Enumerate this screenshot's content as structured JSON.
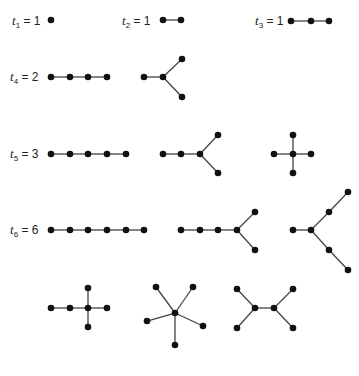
{
  "figure": {
    "rows": [
      {
        "id": "t1",
        "symbol": "t",
        "subscript": "1",
        "eq": " = 1",
        "value": 1,
        "label_pos": [
          12,
          14
        ]
      },
      {
        "id": "t2",
        "symbol": "t",
        "subscript": "2",
        "eq": " = 1",
        "value": 1,
        "label_pos": [
          122,
          14
        ]
      },
      {
        "id": "t3",
        "symbol": "t",
        "subscript": "3",
        "eq": " = 1",
        "value": 1,
        "label_pos": [
          255,
          14
        ]
      },
      {
        "id": "t4",
        "symbol": "t",
        "subscript": "4",
        "eq": " = 2",
        "value": 2,
        "label_pos": [
          10,
          70
        ]
      },
      {
        "id": "t5",
        "symbol": "t",
        "subscript": "5",
        "eq": " = 3",
        "value": 3,
        "label_pos": [
          10,
          147
        ]
      },
      {
        "id": "t6",
        "symbol": "t",
        "subscript": "6",
        "eq": " = 6",
        "value": 6,
        "label_pos": [
          10,
          223
        ]
      }
    ],
    "trees": [
      {
        "name": "t1-single",
        "order": 1,
        "nodes": [
          [
            51,
            20
          ]
        ],
        "edges": []
      },
      {
        "name": "t2-edge",
        "order": 2,
        "nodes": [
          [
            163,
            20
          ],
          [
            181,
            20
          ]
        ],
        "edges": [
          [
            0,
            1
          ]
        ]
      },
      {
        "name": "t3-path",
        "order": 3,
        "nodes": [
          [
            291,
            21
          ],
          [
            311,
            21
          ],
          [
            329,
            21
          ]
        ],
        "edges": [
          [
            0,
            1
          ],
          [
            1,
            2
          ]
        ]
      },
      {
        "name": "t4-path",
        "order": 4,
        "nodes": [
          [
            51,
            77
          ],
          [
            70,
            77
          ],
          [
            88,
            77
          ],
          [
            107,
            77
          ]
        ],
        "edges": [
          [
            0,
            1
          ],
          [
            1,
            2
          ],
          [
            2,
            3
          ]
        ]
      },
      {
        "name": "t4-star",
        "order": 4,
        "nodes": [
          [
            144,
            77
          ],
          [
            163,
            77
          ],
          [
            182,
            59
          ],
          [
            182,
            97
          ]
        ],
        "edges": [
          [
            0,
            1
          ],
          [
            1,
            2
          ],
          [
            1,
            3
          ]
        ]
      },
      {
        "name": "t5-path",
        "order": 5,
        "nodes": [
          [
            51,
            154
          ],
          [
            70,
            154
          ],
          [
            88,
            154
          ],
          [
            107,
            154
          ],
          [
            126,
            154
          ]
        ],
        "edges": [
          [
            0,
            1
          ],
          [
            1,
            2
          ],
          [
            2,
            3
          ],
          [
            3,
            4
          ]
        ]
      },
      {
        "name": "t5-fork",
        "order": 5,
        "nodes": [
          [
            163,
            154
          ],
          [
            181,
            154
          ],
          [
            200,
            154
          ],
          [
            218,
            135
          ],
          [
            218,
            173
          ]
        ],
        "edges": [
          [
            0,
            1
          ],
          [
            1,
            2
          ],
          [
            2,
            3
          ],
          [
            2,
            4
          ]
        ]
      },
      {
        "name": "t5-star",
        "order": 5,
        "nodes": [
          [
            274,
            154
          ],
          [
            293,
            154
          ],
          [
            311,
            154
          ],
          [
            293,
            135
          ],
          [
            293,
            173
          ]
        ],
        "edges": [
          [
            0,
            1
          ],
          [
            1,
            2
          ],
          [
            1,
            3
          ],
          [
            1,
            4
          ]
        ]
      },
      {
        "name": "t6-path",
        "order": 6,
        "nodes": [
          [
            51,
            230
          ],
          [
            70,
            230
          ],
          [
            88,
            230
          ],
          [
            107,
            230
          ],
          [
            126,
            230
          ],
          [
            144,
            230
          ]
        ],
        "edges": [
          [
            0,
            1
          ],
          [
            1,
            2
          ],
          [
            2,
            3
          ],
          [
            3,
            4
          ],
          [
            4,
            5
          ]
        ]
      },
      {
        "name": "t6-long-fork",
        "order": 6,
        "nodes": [
          [
            181,
            230
          ],
          [
            200,
            230
          ],
          [
            218,
            230
          ],
          [
            237,
            230
          ],
          [
            255,
            212
          ],
          [
            255,
            250
          ]
        ],
        "edges": [
          [
            0,
            1
          ],
          [
            1,
            2
          ],
          [
            2,
            3
          ],
          [
            3,
            4
          ],
          [
            3,
            5
          ]
        ]
      },
      {
        "name": "t6-spider",
        "order": 6,
        "nodes": [
          [
            293,
            230
          ],
          [
            311,
            230
          ],
          [
            329,
            212
          ],
          [
            348,
            192
          ],
          [
            329,
            250
          ],
          [
            348,
            270
          ]
        ],
        "edges": [
          [
            0,
            1
          ],
          [
            1,
            2
          ],
          [
            2,
            3
          ],
          [
            1,
            4
          ],
          [
            4,
            5
          ]
        ]
      },
      {
        "name": "t6-cross",
        "order": 6,
        "nodes": [
          [
            51,
            308
          ],
          [
            70,
            308
          ],
          [
            88,
            308
          ],
          [
            107,
            308
          ],
          [
            88,
            288
          ],
          [
            88,
            327
          ]
        ],
        "edges": [
          [
            0,
            1
          ],
          [
            1,
            2
          ],
          [
            2,
            3
          ],
          [
            2,
            4
          ],
          [
            2,
            5
          ]
        ]
      },
      {
        "name": "t6-star",
        "order": 6,
        "nodes": [
          [
            175,
            313
          ],
          [
            156,
            287
          ],
          [
            193,
            287
          ],
          [
            147,
            321
          ],
          [
            203,
            326
          ],
          [
            175,
            345
          ]
        ],
        "edges": [
          [
            0,
            1
          ],
          [
            0,
            2
          ],
          [
            0,
            3
          ],
          [
            0,
            4
          ],
          [
            0,
            5
          ]
        ]
      },
      {
        "name": "t6-double-fork",
        "order": 6,
        "nodes": [
          [
            255,
            308
          ],
          [
            274,
            308
          ],
          [
            237,
            289
          ],
          [
            237,
            328
          ],
          [
            293,
            289
          ],
          [
            293,
            328
          ]
        ],
        "edges": [
          [
            0,
            1
          ],
          [
            0,
            2
          ],
          [
            0,
            3
          ],
          [
            1,
            4
          ],
          [
            1,
            5
          ]
        ]
      }
    ],
    "colors": {
      "node": "#111111",
      "edge": "#444444",
      "text": "#222222",
      "background": "#ffffff"
    },
    "node_radius": 3.3,
    "edge_width": 1.3
  }
}
